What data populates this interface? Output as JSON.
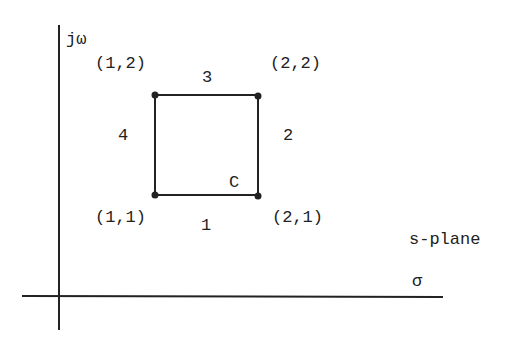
{
  "diagram": {
    "plane_label": "s-plane",
    "axes": {
      "vertical_label": "jω",
      "horizontal_label": "σ"
    },
    "contour": {
      "name": "C",
      "vertices": [
        {
          "label": "(1,1)"
        },
        {
          "label": "(2,1)"
        },
        {
          "label": "(2,2)"
        },
        {
          "label": "(1,2)"
        }
      ],
      "sides": [
        {
          "label": "1"
        },
        {
          "label": "2"
        },
        {
          "label": "3"
        },
        {
          "label": "4"
        }
      ]
    },
    "colors": {
      "ink": "#222222",
      "background": "#ffffff"
    }
  }
}
